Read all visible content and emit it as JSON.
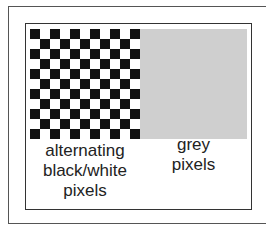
{
  "diagram": {
    "checkerboard": {
      "rows": 11,
      "cols": 11,
      "first_cell_color": "black",
      "colors": {
        "black": "#111111",
        "white": "#ffffff"
      },
      "label_lines": [
        "alternating",
        "black/white",
        "pixels"
      ]
    },
    "grey_panel": {
      "color": "#cfcfcf",
      "label_lines": [
        "grey",
        "pixels"
      ]
    }
  }
}
